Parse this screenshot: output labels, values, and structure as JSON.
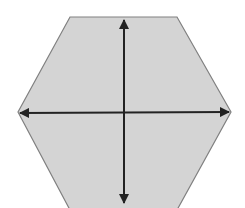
{
  "diagram": {
    "shape": "hexagon",
    "colors": {
      "background": "#ffffff",
      "fill": "#d4d4d4",
      "outline": "#808080",
      "axis": "#222222"
    },
    "hexagon_points": [
      [
        70,
        17
      ],
      [
        177,
        17
      ],
      [
        231,
        112
      ],
      [
        177,
        210
      ],
      [
        70,
        210
      ],
      [
        18,
        112
      ]
    ],
    "axes": [
      {
        "name": "vertical-axis",
        "from": [
          124,
          20
        ],
        "to": [
          124,
          203
        ],
        "double_headed": true
      },
      {
        "name": "horizontal-axis",
        "from": [
          20,
          113
        ],
        "to": [
          229,
          112
        ],
        "double_headed": true
      }
    ],
    "labels": []
  }
}
